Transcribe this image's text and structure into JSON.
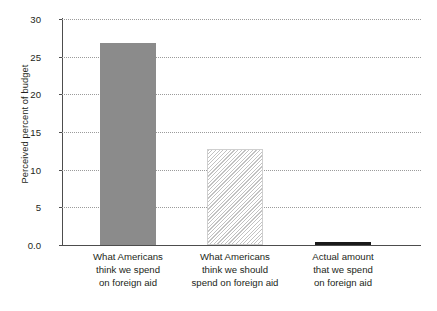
{
  "chart_data": {
    "type": "bar",
    "title": "",
    "xlabel": "",
    "ylabel": "Perceived percent of budget",
    "ylim": [
      0,
      30
    ],
    "yticks": [
      "0.0",
      "5",
      "10",
      "15",
      "20",
      "25",
      "30"
    ],
    "ytick_values": [
      0,
      5,
      10,
      15,
      20,
      25,
      30
    ],
    "grid": "horizontal-dotted",
    "legend": "none",
    "categories": [
      "What Americans think we spend on foreign aid",
      "What Americans think we should spend on foreign aid",
      "Actual amount that we spend on foreign aid"
    ],
    "category_label_lines": [
      [
        "What Americans",
        "think we spend",
        "on foreign aid"
      ],
      [
        "What Americans",
        "think we should",
        "spend on foreign aid"
      ],
      [
        "Actual amount",
        "that we spend",
        "on foreign aid"
      ]
    ],
    "values": [
      26.8,
      12.8,
      0.4
    ],
    "bar_styles": [
      "solid-gray",
      "diagonal-hatch",
      "solid-black"
    ],
    "colors": {
      "bar_solid_gray": "#8b8b8b",
      "bar_hatch_line": "#c2c2c2",
      "bar_dark": "#1a1a1a",
      "axis": "#4d4d4d",
      "gridline": "#9b9b9b",
      "text": "#231f20",
      "background": "#ffffff"
    }
  }
}
